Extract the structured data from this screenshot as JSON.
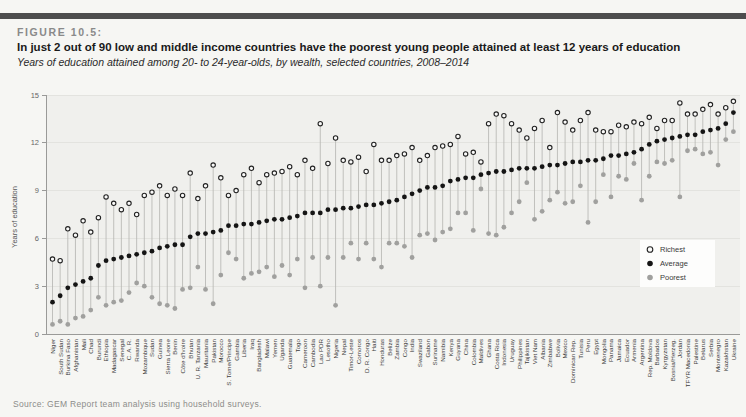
{
  "header": {
    "figure_label": "FIGURE 10.5:",
    "title": "In just 2 out of 90 low and middle income countries have the poorest young people attained at least 12 years of education",
    "subtitle": "Years of education attained among 20- to 24-year-olds, by wealth, selected countries, 2008–2014"
  },
  "source": "Source: GEM Report team analysis using household surveys.",
  "legend": {
    "items": [
      "Richest",
      "Average",
      "Poorest"
    ]
  },
  "colors": {
    "top_bar": "#4d4d4d",
    "page_bg": "#f6f6f3",
    "plot_bg": "#f0f0ed",
    "grid": "#e3e3df",
    "axis": "#9a9a98",
    "tick_text": "#666666",
    "country_label": "#3c3c3c",
    "stem": "#b4b4b0",
    "richest_fill": "#fbfbfa",
    "richest_stroke": "#222222",
    "average_fill": "#151515",
    "poorest_fill": "#a0a09e",
    "legend_bg": "#fdfdfc",
    "legend_text": "#3a3a3a"
  },
  "chart_data": {
    "type": "scatter",
    "title": "Years of education attained among 20- to 24-year-olds, by wealth, selected countries, 2008–2014",
    "xlabel": "",
    "ylabel": "Years of education",
    "ylim": [
      0,
      15
    ],
    "yticks": [
      0,
      3,
      6,
      9,
      12,
      15
    ],
    "grid": true,
    "legend_position": "inside-right",
    "categories": [
      "Niger",
      "South Sudan",
      "Burkina Faso",
      "Afghanistan",
      "Mali",
      "Chad",
      "Burundi",
      "Ethiopia",
      "Madagascar",
      "Senegal",
      "C. A. R.",
      "Rwanda",
      "Mozambique",
      "Sudan",
      "Guinea",
      "Sierra Leone",
      "Benin",
      "Côte d'Ivoire",
      "Bhutan",
      "U. R. Tanzania",
      "Mauritania",
      "Pakistan",
      "Morocco",
      "S. Tome/Principe",
      "Gambia",
      "Liberia",
      "Iraq",
      "Bangladesh",
      "Malawi",
      "Yemen",
      "Uganda",
      "Guatemala",
      "Togo",
      "Cameroon",
      "Cambodia",
      "Lao PDR",
      "Lesotho",
      "Nigeria",
      "Nepal",
      "Timor-Leste",
      "Comoros",
      "D. R. Congo",
      "Haiti",
      "Honduras",
      "Belize",
      "Zambia",
      "Congo",
      "India",
      "Swaziland",
      "Gabon",
      "Suriname",
      "Namibia",
      "Kenya",
      "Guyana",
      "China",
      "Colombia",
      "Maldives",
      "Ghana",
      "Costa Rica",
      "Indonesia",
      "Uruguay",
      "Philippines",
      "Tajikistan",
      "Viet Nam",
      "Albania",
      "Zimbabwe",
      "Bolivia",
      "Mexico",
      "Dominican Rep.",
      "Tunisia",
      "Peru",
      "Egypt",
      "Mongolia",
      "Panama",
      "Jamaica",
      "Ecuador",
      "Armenia",
      "Argentina",
      "Rep. Moldova",
      "Barbados",
      "Kyrgyzstan",
      "Bosnia/Herzeg.",
      "Jordan",
      "TFYR Macedonia",
      "Palestine",
      "Belarus",
      "Serbia",
      "Montenegro",
      "Kazakhstan",
      "Ukraine"
    ],
    "series": [
      {
        "name": "Richest",
        "marker": "open-circle",
        "values": [
          4.7,
          4.6,
          6.6,
          6.2,
          7.1,
          6.4,
          7.3,
          8.6,
          8.2,
          7.8,
          8.2,
          7.5,
          8.7,
          8.9,
          9.3,
          8.7,
          9.1,
          8.7,
          10.1,
          8.5,
          9.3,
          10.6,
          9.8,
          8.7,
          9.0,
          10.0,
          10.4,
          9.5,
          10.0,
          10.1,
          10.2,
          10.5,
          10.0,
          10.9,
          10.4,
          13.2,
          10.7,
          12.3,
          10.9,
          10.8,
          11.1,
          10.2,
          11.9,
          10.9,
          10.9,
          11.2,
          11.3,
          11.7,
          10.9,
          11.2,
          11.7,
          11.8,
          11.9,
          12.4,
          11.3,
          11.4,
          10.8,
          13.2,
          13.8,
          13.7,
          13.2,
          12.8,
          12.3,
          12.9,
          13.4,
          11.7,
          13.9,
          13.3,
          12.8,
          13.4,
          13.9,
          12.8,
          12.7,
          12.7,
          13.1,
          13.0,
          13.3,
          13.2,
          13.6,
          12.9,
          13.4,
          13.4,
          14.5,
          13.8,
          13.8,
          14.1,
          14.4,
          13.8,
          14.2,
          14.6
        ]
      },
      {
        "name": "Average",
        "marker": "filled-circle-black",
        "values": [
          2.0,
          2.4,
          2.9,
          3.1,
          3.3,
          3.5,
          4.3,
          4.6,
          4.7,
          4.8,
          4.9,
          5.0,
          5.1,
          5.2,
          5.4,
          5.5,
          5.6,
          5.6,
          6.1,
          6.3,
          6.3,
          6.4,
          6.5,
          6.8,
          6.8,
          6.9,
          6.9,
          7.0,
          7.1,
          7.2,
          7.2,
          7.3,
          7.4,
          7.6,
          7.6,
          7.6,
          7.8,
          7.8,
          7.9,
          7.9,
          8.0,
          8.1,
          8.1,
          8.2,
          8.3,
          8.4,
          8.6,
          8.8,
          9.0,
          9.2,
          9.2,
          9.3,
          9.6,
          9.7,
          9.8,
          9.8,
          10.0,
          10.1,
          10.2,
          10.2,
          10.3,
          10.4,
          10.4,
          10.4,
          10.5,
          10.6,
          10.6,
          10.7,
          10.8,
          10.8,
          10.9,
          10.9,
          11.0,
          11.2,
          11.2,
          11.3,
          11.4,
          11.6,
          11.9,
          12.1,
          12.2,
          12.3,
          12.4,
          12.5,
          12.5,
          12.7,
          12.8,
          12.9,
          13.2,
          13.9
        ]
      },
      {
        "name": "Poorest",
        "marker": "filled-circle-gray",
        "values": [
          0.6,
          0.8,
          0.6,
          1.0,
          1.1,
          1.5,
          2.3,
          1.8,
          2.0,
          2.1,
          2.6,
          3.2,
          3.0,
          2.3,
          1.9,
          1.8,
          1.6,
          2.8,
          2.9,
          4.2,
          2.8,
          1.9,
          3.7,
          5.1,
          4.7,
          3.5,
          3.8,
          3.9,
          4.2,
          3.6,
          4.3,
          3.7,
          4.7,
          2.9,
          4.8,
          3.0,
          4.8,
          1.8,
          4.8,
          5.7,
          4.7,
          5.7,
          4.7,
          4.2,
          5.7,
          5.7,
          5.5,
          4.8,
          6.2,
          6.3,
          5.9,
          6.4,
          6.6,
          7.6,
          7.6,
          6.5,
          9.1,
          6.3,
          6.2,
          6.7,
          7.6,
          8.3,
          9.5,
          7.2,
          7.7,
          8.4,
          8.9,
          8.2,
          8.3,
          9.3,
          7.0,
          8.3,
          10.0,
          8.6,
          9.9,
          9.7,
          10.7,
          8.4,
          9.9,
          10.8,
          10.7,
          10.9,
          8.6,
          11.5,
          11.6,
          11.3,
          11.4,
          10.6,
          12.2,
          12.7
        ]
      }
    ]
  }
}
